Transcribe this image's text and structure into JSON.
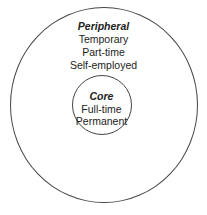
{
  "outer": {
    "title": "Peripheral",
    "items": [
      "Temporary",
      "Part-time",
      "Self-employed"
    ]
  },
  "inner": {
    "title": "Core",
    "items": [
      "Full-time",
      "Permanent"
    ]
  }
}
